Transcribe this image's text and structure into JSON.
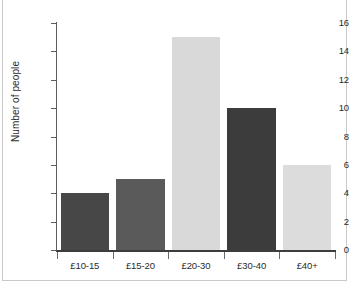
{
  "chart_data": {
    "type": "bar",
    "title": "",
    "subtitle": "",
    "xlabel": "",
    "ylabel": "Number of people",
    "categories": [
      "£10-15",
      "£15-20",
      "£20-30",
      "£30-40",
      "£40+"
    ],
    "values": [
      4,
      5,
      15,
      10,
      6
    ],
    "bar_colors": [
      "#474747",
      "#5a5a5a",
      "#d9d9d9",
      "#3c3c3c",
      "#dcdcdc"
    ],
    "ylim": [
      0,
      16
    ],
    "yticks": [
      0,
      2,
      4,
      6,
      8,
      10,
      12,
      14,
      16
    ],
    "ytick_labels": [
      "0",
      "2",
      "4",
      "6",
      "8",
      "10",
      "12",
      "14",
      "16"
    ],
    "grid": false,
    "legend": null,
    "legend_position": "none",
    "annotations": []
  },
  "figure": {
    "background_color": "#ffffff",
    "frame_color": "#c9c9c9",
    "axis_color": "#3d3d3d",
    "tick_label_color": "#2b2b2b"
  }
}
